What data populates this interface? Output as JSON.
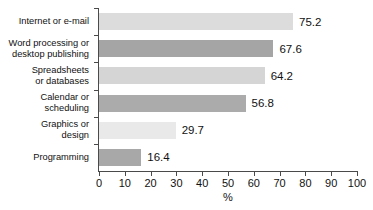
{
  "chart_data": {
    "type": "bar",
    "orientation": "horizontal",
    "title": "",
    "xlabel": "%",
    "ylabel": "",
    "xlim": [
      0,
      100
    ],
    "xticks": [
      0,
      10,
      20,
      30,
      40,
      50,
      60,
      70,
      80,
      90,
      100
    ],
    "grid": false,
    "legend": false,
    "categories": [
      "Internet or e-mail",
      "Word processing or desktop publishing",
      "Spreadsheets or databases",
      "Calendar or scheduling",
      "Graphics or design",
      "Programming"
    ],
    "values": [
      75.2,
      67.6,
      64.2,
      56.8,
      29.7,
      16.4
    ],
    "bar_colors": [
      "#dcdcdc",
      "#a5a5a5",
      "#d5d5d5",
      "#ababab",
      "#e9e9e9",
      "#a8a8a8"
    ]
  },
  "bars": [
    {
      "label_lines": [
        "Internet or e-mail"
      ],
      "value": 75.2,
      "value_text": "75.2",
      "color": "#dcdcdc"
    },
    {
      "label_lines": [
        "Word processing or",
        "desktop publishing"
      ],
      "value": 67.6,
      "value_text": "67.6",
      "color": "#a5a5a5"
    },
    {
      "label_lines": [
        "Spreadsheets",
        "or databases"
      ],
      "value": 64.2,
      "value_text": "64.2",
      "color": "#d5d5d5"
    },
    {
      "label_lines": [
        "Calendar or",
        "scheduling"
      ],
      "value": 56.8,
      "value_text": "56.8",
      "color": "#ababab"
    },
    {
      "label_lines": [
        "Graphics or",
        "design"
      ],
      "value": 29.7,
      "value_text": "29.7",
      "color": "#e9e9e9"
    },
    {
      "label_lines": [
        "Programming"
      ],
      "value": 16.4,
      "value_text": "16.4",
      "color": "#a8a8a8"
    }
  ],
  "axis": {
    "x_title": "%",
    "tick_labels": [
      "0",
      "10",
      "20",
      "30",
      "40",
      "50",
      "60",
      "70",
      "80",
      "90",
      "100"
    ],
    "axis_color": "#4a4a4a"
  }
}
